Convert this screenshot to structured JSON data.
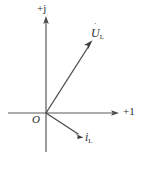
{
  "diagram": {
    "kind": "phasor-diagram",
    "background_color": "#ffffff",
    "line_color": "#5a5a5a",
    "text_color": "#2c2c2c",
    "width": 145,
    "height": 170,
    "axes": {
      "imaginary": {
        "label": "+j",
        "x": 46,
        "y_top": 18,
        "y_bottom": 152,
        "arrow": "up"
      },
      "real": {
        "label": "+1",
        "y": 113,
        "x_left": 8,
        "x_right": 117,
        "arrow": "right"
      },
      "origin": {
        "label": "O",
        "x": 46,
        "y": 113
      }
    },
    "phasors": [
      {
        "name": "voltage-phasor",
        "symbol": "U",
        "dot": "˙",
        "subscript": "L",
        "label_text": "U̇L",
        "origin": {
          "x": 46,
          "y": 113
        },
        "tip": {
          "x": 92,
          "y": 41
        },
        "angle_deg": 57.4,
        "label_position": {
          "x": 91,
          "y": 27
        }
      },
      {
        "name": "current-phasor",
        "symbol": "i",
        "dot": "˙",
        "subscript": "L",
        "label_text": "i̇L",
        "origin": {
          "x": 46,
          "y": 113
        },
        "tip": {
          "x": 83,
          "y": 137
        },
        "angle_deg": -33.0,
        "label_position": {
          "x": 85,
          "y": 131
        }
      }
    ]
  },
  "labels": {
    "imaginary_axis": "+j",
    "real_axis": "+1",
    "origin": "O",
    "voltage_symbol": "U",
    "voltage_subscript": "L",
    "current_symbol": "i",
    "current_subscript": "L",
    "phasor_dot": "˙"
  }
}
